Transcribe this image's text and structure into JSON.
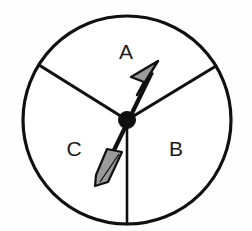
{
  "figure": {
    "type": "spinner-wheel",
    "background_color": "#fefefe",
    "outline_color": "#101010",
    "fill_color": "#ffffff",
    "arrow_fill_color": "#9a9a9a",
    "arrow_outline_color": "#101010"
  },
  "wheel": {
    "center_x": 127,
    "center_y": 120,
    "radius": 104,
    "stroke_width": 3,
    "sectors": [
      {
        "id": "sector-a",
        "label": "A",
        "label_x": 126,
        "label_y": 53,
        "start_angle_deg": 31,
        "end_angle_deg": 148,
        "span_deg": 117
      },
      {
        "id": "sector-b",
        "label": "B",
        "label_x": 176,
        "label_y": 150,
        "start_angle_deg": 270,
        "end_angle_deg": 31,
        "span_deg": 121
      },
      {
        "id": "sector-c",
        "label": "C",
        "label_x": 74,
        "label_y": 150,
        "start_angle_deg": 148,
        "end_angle_deg": 270,
        "span_deg": 122
      }
    ],
    "spokes": [
      {
        "id": "spoke-upper-left",
        "angle_deg": 148,
        "end_x": 39,
        "end_y": 65
      },
      {
        "id": "spoke-upper-right",
        "angle_deg": 31,
        "end_x": 216,
        "end_y": 66
      },
      {
        "id": "spoke-bottom",
        "angle_deg": 270,
        "end_x": 127,
        "end_y": 224
      }
    ]
  },
  "arrow": {
    "id": "spinner-arrow",
    "points_to_sector": "A",
    "angle_deg": 64,
    "tip_x": 158,
    "tip_y": 61,
    "tail_x": 98,
    "tail_y": 182,
    "shaft_width": 4,
    "hub_radius": 8,
    "head_length": 30,
    "head_half_width": 11,
    "fletch_length": 36
  }
}
